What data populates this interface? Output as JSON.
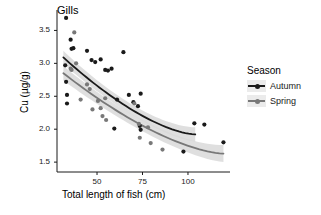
{
  "chart_data": {
    "type": "scatter",
    "title": "Gills",
    "xlabel": "Total length of fish (cm)",
    "ylabel": "Cu (µg/g)",
    "xlim": [
      28,
      122
    ],
    "ylim": [
      1.35,
      3.78
    ],
    "xticks": [
      50,
      75,
      100
    ],
    "xtick_labels": [
      "50",
      "75",
      "100"
    ],
    "yticks": [
      1.5,
      2.0,
      2.5,
      3.0,
      3.5
    ],
    "ytick_labels": [
      "1.5",
      "2.0",
      "2.5",
      "3.0",
      "3.5"
    ],
    "grid": false,
    "legend": {
      "title": "Season",
      "position": "right",
      "entries": [
        {
          "name": "Autumn",
          "color": "#1a1a1a"
        },
        {
          "name": "Spring",
          "color": "#787878"
        }
      ]
    },
    "series": [
      {
        "name": "Autumn",
        "color": "#1a1a1a",
        "marker": "circle",
        "points": [
          [
            33.0,
            3.69
          ],
          [
            32.5,
            2.97
          ],
          [
            33.0,
            2.72
          ],
          [
            33.5,
            2.52
          ],
          [
            33.5,
            2.39
          ],
          [
            35.5,
            3.36
          ],
          [
            36.0,
            3.22
          ],
          [
            37.0,
            3.23
          ],
          [
            44.5,
            3.19
          ],
          [
            47.0,
            3.05
          ],
          [
            49.0,
            3.02
          ],
          [
            52.0,
            3.06
          ],
          [
            54.5,
            2.9
          ],
          [
            56.0,
            2.89
          ],
          [
            58.0,
            2.92
          ],
          [
            59.5,
            2.01
          ],
          [
            61.0,
            2.45
          ],
          [
            64.5,
            3.17
          ],
          [
            67.5,
            2.52
          ],
          [
            70.0,
            2.41
          ],
          [
            72.5,
            2.35
          ],
          [
            74.0,
            2.54
          ],
          [
            73.5,
            2.05
          ],
          [
            74.0,
            1.99
          ],
          [
            97.5,
            1.66
          ],
          [
            103.5,
            2.09
          ],
          [
            109.0,
            2.07
          ],
          [
            119.5,
            1.8
          ]
        ],
        "fit_line": {
          "x_start": 31.5,
          "x_end": 104.0,
          "y_start": 3.09,
          "y_end": 1.92,
          "ci_halfwidth_start": 0.1,
          "ci_halfwidth_mid": 0.055,
          "ci_halfwidth_end": 0.11
        }
      },
      {
        "name": "Spring",
        "color": "#787878",
        "marker": "circle",
        "points": [
          [
            37.5,
            3.47
          ],
          [
            35.5,
            2.92
          ],
          [
            36.0,
            2.9
          ],
          [
            38.5,
            3.0
          ],
          [
            41.0,
            2.45
          ],
          [
            44.5,
            2.68
          ],
          [
            46.0,
            2.61
          ],
          [
            47.5,
            2.3
          ],
          [
            50.5,
            2.43
          ],
          [
            52.0,
            2.32
          ],
          [
            53.0,
            2.2
          ],
          [
            54.5,
            2.47
          ],
          [
            55.0,
            2.14
          ],
          [
            70.5,
            2.39
          ],
          [
            73.0,
            2.08
          ],
          [
            73.5,
            1.87
          ],
          [
            78.0,
            2.03
          ],
          [
            79.5,
            1.79
          ],
          [
            86.0,
            1.69
          ]
        ],
        "fit_line": {
          "x_start": 31.5,
          "x_end": 119.5,
          "y_start": 2.85,
          "y_end": 1.63,
          "ci_halfwidth_start": 0.11,
          "ci_halfwidth_mid": 0.05,
          "ci_halfwidth_end": 0.13
        }
      }
    ]
  }
}
